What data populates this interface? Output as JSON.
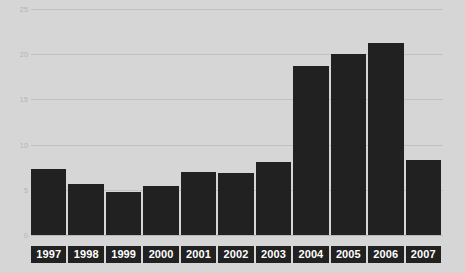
{
  "chart_data": {
    "type": "bar",
    "title": "",
    "subtitle": "",
    "xlabel": "",
    "ylabel": "",
    "categories": [
      "1997",
      "1998",
      "1999",
      "2000",
      "2001",
      "2002",
      "2003",
      "2004",
      "2005",
      "2006",
      "2007"
    ],
    "values": [
      7.3,
      5.6,
      4.8,
      5.4,
      7.0,
      6.9,
      8.1,
      18.7,
      20.0,
      21.2,
      8.3
    ],
    "ylim": [
      0,
      25
    ],
    "yticks": [
      0,
      5,
      10,
      15,
      20,
      25
    ],
    "ytick_labels": [
      "0",
      "5",
      "10",
      "15",
      "20",
      "25"
    ],
    "grid": true,
    "legend": false,
    "legend_position": "none",
    "bar_color": "#212121",
    "background_color": "#d6d6d6",
    "gridline_color": "#c2c2c2",
    "ytick_label_color": "#b3b3b3",
    "xtick_label_color": "#ffffff",
    "xtick_box_color": "#212121"
  }
}
